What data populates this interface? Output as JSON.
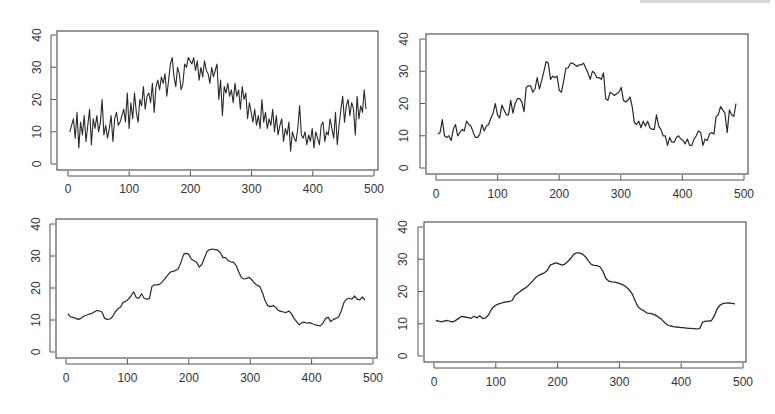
{
  "figure": {
    "layout": "2x2 grid of line plots",
    "line_color": "#2a2a2a",
    "frame_color": "#555555",
    "background": "#ffffff"
  },
  "chart_data": [
    {
      "type": "line",
      "title": "",
      "panel": "top-left",
      "description": "raw noisy series",
      "xlabel": "",
      "ylabel": "",
      "xlim": [
        0,
        500
      ],
      "ylim": [
        0,
        40
      ],
      "x_ticks": [
        0,
        100,
        200,
        300,
        400,
        500
      ],
      "y_ticks": [
        0,
        10,
        20,
        30,
        40
      ],
      "grid": false,
      "stroke_width": 1.1,
      "x_start": 3,
      "x_step": 5,
      "values": [
        10,
        12,
        14,
        8,
        16,
        5,
        13,
        9,
        15,
        7,
        12,
        17,
        6,
        14,
        11,
        15,
        10,
        13,
        20,
        9,
        12,
        8,
        11,
        15,
        7,
        14,
        16,
        12,
        13,
        15,
        17,
        13,
        22,
        11,
        19,
        14,
        22,
        16,
        13,
        20,
        18,
        24,
        17,
        21,
        22,
        19,
        25,
        16,
        24,
        26,
        23,
        27,
        25,
        28,
        21,
        26,
        31,
        33,
        27,
        24,
        30,
        28,
        23,
        25,
        31,
        30,
        33,
        32,
        31,
        33,
        29,
        32,
        26,
        30,
        27,
        32,
        29,
        28,
        25,
        30,
        27,
        29,
        31,
        20,
        26,
        15,
        24,
        22,
        25,
        21,
        23,
        19,
        25,
        21,
        23,
        17,
        24,
        20,
        22,
        14,
        19,
        16,
        13,
        17,
        12,
        15,
        11,
        20,
        13,
        16,
        11,
        14,
        12,
        17,
        10,
        15,
        9,
        12,
        14,
        7,
        11,
        9,
        13,
        4,
        10,
        8,
        7,
        11,
        18,
        9,
        8,
        10,
        6,
        9,
        7,
        11,
        5,
        10,
        8,
        6,
        12,
        13,
        7,
        10,
        9,
        14,
        11,
        8,
        16,
        6,
        12,
        17,
        21,
        13,
        18,
        20,
        15,
        19,
        17,
        9,
        21,
        14,
        18,
        16,
        23,
        17
      ]
    },
    {
      "type": "line",
      "title": "",
      "panel": "top-right",
      "description": "lightly smoothed series",
      "xlabel": "",
      "ylabel": "",
      "xlim": [
        0,
        500
      ],
      "ylim": [
        0,
        40
      ],
      "x_ticks": [
        0,
        100,
        200,
        300,
        400,
        500
      ],
      "y_ticks": [
        0,
        10,
        20,
        30,
        40
      ],
      "grid": false,
      "stroke_width": 1.2,
      "x_start": 3,
      "x_step": 5,
      "values": [
        10.5,
        11,
        15,
        10,
        9.5,
        10,
        8.5,
        12,
        13.5,
        10,
        11,
        12,
        11.5,
        14.5,
        13.5,
        13,
        11,
        9.5,
        9.5,
        10.5,
        13.5,
        11.5,
        13,
        13.5,
        15.5,
        17,
        20,
        16.5,
        15.5,
        19.5,
        18,
        16.5,
        16.5,
        21,
        17,
        20,
        21.5,
        21.5,
        20.5,
        17.5,
        25,
        25.5,
        25.5,
        23.5,
        24.5,
        28,
        24.5,
        27,
        30,
        33,
        32.5,
        27.5,
        28.5,
        28,
        28.5,
        24,
        23.5,
        27,
        31,
        31,
        32.5,
        32.5,
        32,
        31.5,
        32,
        32,
        32.5,
        31,
        29.5,
        27.5,
        30,
        29.5,
        28,
        28,
        27.5,
        29.5,
        21.5,
        21,
        23.5,
        23,
        22.5,
        23,
        23.5,
        25,
        21,
        20.5,
        21,
        22,
        19,
        14,
        13.5,
        14.5,
        12.5,
        14.5,
        13,
        14.5,
        12.5,
        12,
        12,
        16.5,
        13,
        12,
        10,
        10,
        7,
        9.5,
        8,
        8,
        9.5,
        10,
        9,
        8.5,
        7.5,
        9,
        7,
        7,
        9,
        10,
        11.5,
        11,
        7,
        9,
        8.5,
        10.5,
        11,
        10.5,
        16,
        16.5,
        19,
        18,
        17,
        11,
        18,
        16.5,
        16,
        20
      ]
    },
    {
      "type": "line",
      "title": "",
      "panel": "bottom-left",
      "description": "moderately smoothed series",
      "xlabel": "",
      "ylabel": "",
      "xlim": [
        0,
        500
      ],
      "ylim": [
        0,
        40
      ],
      "x_ticks": [
        0,
        100,
        200,
        300,
        400,
        500
      ],
      "y_ticks": [
        0,
        10,
        20,
        30,
        40
      ],
      "grid": false,
      "stroke_width": 1.2,
      "x_start": 3,
      "x_step": 5,
      "values": [
        12,
        11,
        10.8,
        10.5,
        10.2,
        10.5,
        11.2,
        11.5,
        11.8,
        12,
        12.5,
        13,
        12.8,
        12.5,
        10.5,
        10.2,
        10.3,
        11,
        12.5,
        13.5,
        14,
        15.5,
        15.8,
        16.5,
        17.5,
        18.8,
        17,
        16.8,
        18.2,
        16.8,
        16.5,
        16.7,
        20.5,
        21,
        21,
        21.2,
        22,
        23,
        24,
        25,
        25.2,
        25.5,
        26,
        28,
        30.5,
        30.8,
        30.5,
        29,
        28.5,
        28,
        26.5,
        27.5,
        29.5,
        31.5,
        32,
        32.2,
        32,
        31.8,
        31,
        29.5,
        29.5,
        28.5,
        28.2,
        28,
        27,
        25,
        23.2,
        22.8,
        23,
        23.3,
        22.5,
        21.5,
        20.8,
        20.5,
        18.5,
        16,
        14.5,
        14.2,
        14.5,
        14,
        13,
        12.7,
        12.5,
        12.3,
        12.8,
        12,
        10.5,
        9.5,
        8.5,
        9.2,
        9.3,
        9,
        9.2,
        8.8,
        8.5,
        8.3,
        8.2,
        9,
        10.5,
        10.8,
        9.5,
        10.2,
        10.5,
        11,
        12.8,
        15.5,
        16.5,
        16.8,
        16.5,
        17.5,
        16.5,
        16.3,
        17.2,
        16.2
      ]
    },
    {
      "type": "line",
      "title": "",
      "panel": "bottom-right",
      "description": "heavily smoothed series",
      "xlabel": "",
      "ylabel": "",
      "xlim": [
        0,
        500
      ],
      "ylim": [
        0,
        40
      ],
      "x_ticks": [
        0,
        100,
        200,
        300,
        400,
        500
      ],
      "y_ticks": [
        0,
        10,
        20,
        30,
        40
      ],
      "grid": false,
      "stroke_width": 1.3,
      "x_start": 3,
      "x_step": 5,
      "values": [
        11,
        10.8,
        10.6,
        10.9,
        11,
        10.7,
        10.6,
        11.2,
        11.8,
        12.3,
        12.1,
        11.9,
        11.7,
        12.3,
        11.8,
        12.5,
        11.6,
        11.8,
        12.8,
        14.5,
        15.5,
        16,
        16.3,
        16.6,
        16.8,
        16.9,
        17.2,
        18.8,
        19.5,
        20.2,
        20.8,
        21.4,
        22.3,
        23.2,
        24.3,
        25,
        25.4,
        25.8,
        26.5,
        28.2,
        28.6,
        28.9,
        28.6,
        28.2,
        28.5,
        29.3,
        30.3,
        31.5,
        32,
        32,
        31.6,
        30.8,
        29.5,
        28.4,
        28.1,
        28,
        27.6,
        26.2,
        24,
        23.2,
        23,
        22.9,
        22.7,
        22.4,
        22,
        21.3,
        20.5,
        19.2,
        17,
        15.2,
        14.5,
        14,
        13.3,
        13.2,
        13,
        12.6,
        12,
        11.3,
        10.4,
        9.6,
        9.3,
        9.1,
        9,
        8.9,
        8.8,
        8.7,
        8.6,
        8.6,
        8.5,
        8.4,
        8.5,
        10.5,
        10.8,
        10.8,
        11,
        12.5,
        14.8,
        15.8,
        16.3,
        16.4,
        16.5,
        16.3,
        16.2
      ]
    }
  ],
  "panels": [
    {
      "name": "panel-top-left",
      "box": [
        57,
        31,
        378,
        170
      ],
      "x0_px": 68,
      "x500_px": 374,
      "y0_px": 164,
      "y40_px": 35,
      "xlabel_y": 193,
      "ylabel_x": 37,
      "x_tick_labels": [
        "0",
        "100",
        "200",
        "300",
        "400",
        "500"
      ],
      "y_tick_labels": [
        "0",
        "10",
        "20",
        "30",
        "40"
      ]
    },
    {
      "name": "panel-top-right",
      "box": [
        426,
        34,
        748,
        174
      ],
      "x0_px": 436,
      "x500_px": 744,
      "y0_px": 168,
      "y40_px": 39,
      "xlabel_y": 198,
      "ylabel_x": 404,
      "x_tick_labels": [
        "0",
        "100",
        "200",
        "300",
        "400",
        "500"
      ],
      "y_tick_labels": [
        "0",
        "10",
        "20",
        "30",
        "40"
      ]
    },
    {
      "name": "panel-bottom-left",
      "box": [
        56,
        219,
        377,
        358
      ],
      "x0_px": 66,
      "x500_px": 373,
      "y0_px": 352,
      "y40_px": 224,
      "xlabel_y": 382,
      "ylabel_x": 36,
      "x_tick_labels": [
        "0",
        "100",
        "200",
        "300",
        "400",
        "500"
      ],
      "y_tick_labels": [
        "0",
        "10",
        "20",
        "30",
        "40"
      ]
    },
    {
      "name": "panel-bottom-right",
      "box": [
        424,
        222,
        746,
        362
      ],
      "x0_px": 434,
      "x500_px": 743,
      "y0_px": 356,
      "y40_px": 227,
      "xlabel_y": 386,
      "ylabel_x": 403,
      "x_tick_labels": [
        "0",
        "100",
        "200",
        "300",
        "400",
        "500"
      ],
      "y_tick_labels": [
        "0",
        "10",
        "20",
        "30",
        "40"
      ]
    }
  ]
}
